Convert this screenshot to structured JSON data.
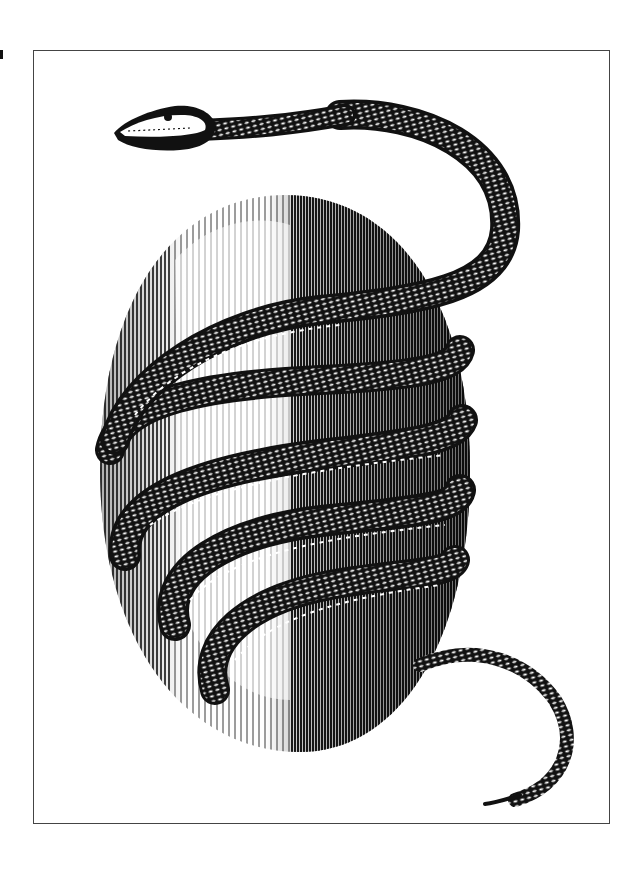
{
  "illustration": {
    "subject": "Engraving of a snake coiled around an egg",
    "style": "black and white line engraving",
    "frame": {
      "border_color": "#444444"
    },
    "colors": {
      "ink": "#111111",
      "paper": "#ffffff"
    },
    "elements": [
      "egg",
      "snake-head",
      "snake-body-coils",
      "snake-tail"
    ],
    "coil_count": 5
  }
}
